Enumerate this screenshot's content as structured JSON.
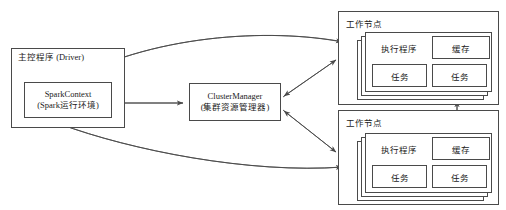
{
  "diagram": {
    "type": "block-diagram",
    "stroke_color": "#4a4a4a",
    "text_color": "#1a1a1a",
    "background_color": "#ffffff"
  },
  "driver": {
    "label": "主控程序 (Driver)",
    "context": {
      "line1": "SparkContext",
      "line2": "(Spark运行环境)"
    }
  },
  "cluster_manager": {
    "line1": "ClusterManager",
    "line2": "(集群资源管理器)"
  },
  "workers": [
    {
      "title": "工作节点",
      "executor_label": "执行程序",
      "cache_label": "缓存",
      "tasks": [
        "任务",
        "任务"
      ]
    },
    {
      "title": "工作节点",
      "executor_label": "执行程序",
      "cache_label": "缓存",
      "tasks": [
        "任务",
        "任务"
      ]
    }
  ],
  "edges": [
    {
      "name": "sparkcontext-clustermanager",
      "style": "double-arrow"
    },
    {
      "name": "clustermanager-worker-top",
      "style": "arrow"
    },
    {
      "name": "clustermanager-worker-bottom",
      "style": "arrow"
    },
    {
      "name": "worker-top-sparkcontext",
      "style": "curved-arrow"
    },
    {
      "name": "worker-bottom-sparkcontext",
      "style": "curved-arrow"
    },
    {
      "name": "worker-top-worker-bottom",
      "style": "double-arrow"
    }
  ]
}
